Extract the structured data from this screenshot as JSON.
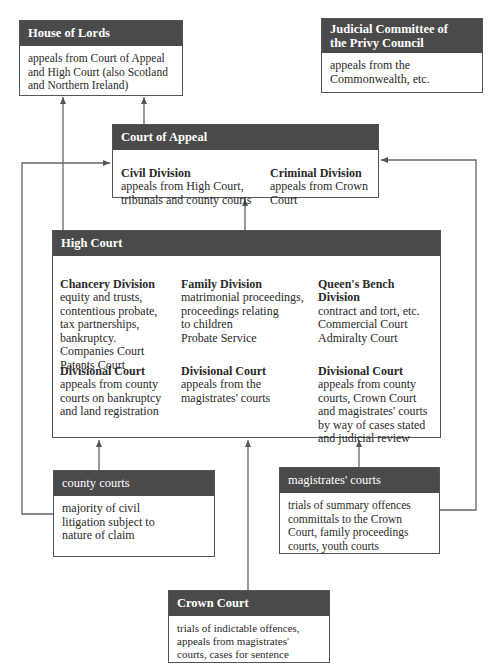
{
  "diagram": {
    "house_of_lords": {
      "title": "House of Lords",
      "text": "appeals from Court of Appeal\nand High Court (also Scotland\nand Northern Ireland)"
    },
    "privy_council": {
      "title": "Judicial Committee of\nthe Privy Council",
      "text": "appeals from the\nCommonwealth, etc."
    },
    "court_of_appeal": {
      "title": "Court of Appeal",
      "civil": {
        "heading": "Civil Division",
        "text": "appeals from High Court,\ntribunals and county courts"
      },
      "criminal": {
        "heading": "Criminal Division",
        "text": "appeals from Crown\nCourt"
      }
    },
    "high_court": {
      "title": "High Court",
      "chancery": {
        "heading": "Chancery Division",
        "text": "equity and trusts,\ncontentious probate,\ntax partnerships,\nbankruptcy.\nCompanies Court\nPatents Court"
      },
      "family": {
        "heading": "Family Division",
        "text": "matrimonial proceedings,\nproceedings relating\nto children\nProbate Service"
      },
      "queens_bench": {
        "heading": "Queen's Bench\nDivision",
        "text": "contract and tort, etc.\nCommercial Court\nAdmiralty Court"
      },
      "div_chancery": {
        "heading": "Divisional Court",
        "text": "appeals from county\ncourts on bankruptcy\nand land registration"
      },
      "div_family": {
        "heading": "Divisional Court",
        "text": "appeals from the\nmagistrates' courts"
      },
      "div_qb": {
        "heading": "Divisional Court",
        "text": "appeals from county\ncourts, Crown Court\nand magistrates' courts\nby way of cases stated\nand judicial review"
      }
    },
    "county_courts": {
      "title": "county courts",
      "text": "majority of civil\nlitigation subject to\nnature of claim"
    },
    "magistrates_courts": {
      "title": "magistrates' courts",
      "text": "trials of summary offences\ncommittals to the Crown\nCourt, family proceedings\ncourts, youth courts"
    },
    "crown_court": {
      "title": "Crown Court",
      "text": "trials of indictable offences,\nappeals from magistrates'\ncourts, cases for sentence"
    }
  },
  "colors": {
    "header_bg": "#4a4a4a",
    "line": "#555555"
  }
}
